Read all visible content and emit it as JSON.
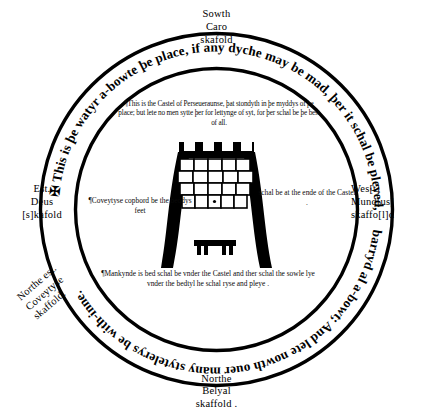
{
  "diagram": {
    "ring_inscription": "✠ This is þe watyr a-bowte þe place, if any dyche may be mad, þer it schal be pleyed, or ellys þat it be strongly barryd al a-bowt; And lete nowth ouer many stytelerys be with-inne.",
    "ring_inscription_start": "✠ This is þe watyr a-bowte þe place, if any dyche may be mad, þer it schal be pleyed, or ellys þat it be strongly",
    "ring_inscription_end": "barryd al a-bowt; And lete nowth ouer many stytelerys be with-inne."
  },
  "cardinals": {
    "south": "Sowth\nCaro\nskafold",
    "north": "Northe\nBelyal\nskaffold .",
    "east": "Est.\nDeus\n[s]kafold",
    "west": "Wes[t]\nMund[us]\nskaffo[l]d",
    "northeast": "Northe est.\nCoveytyse\nskaffold."
  },
  "annotations": {
    "castle": "¶This is the Castel of Perseueraunse, þat stondyth in þe myddys of þe place; but lete no men sytte þer for lettynge of syt, for þer schal be þe best of all.",
    "coveytyse": "¶Coveytyse copbord be the beddys feet",
    "castel_ende": "schal be at the ende of the Castel .",
    "mankynde": "¶Mankynde is bed schal be vnder the Castel and ther schal the sowle lye vnder the bedtyl he schal ryse and pleye ."
  },
  "colors": {
    "ink": "#000000",
    "paper": "#ffffff"
  }
}
